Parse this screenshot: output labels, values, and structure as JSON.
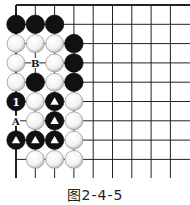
{
  "caption": "图2-4-5",
  "board": {
    "origin_x": 16,
    "origin_y": 5,
    "spacing": 19.3,
    "cols": 9,
    "rows": 10,
    "edges": {
      "top": true,
      "left": true,
      "right": false,
      "bottom": false
    },
    "stones": [
      {
        "col": 0,
        "row": 1,
        "color": "black"
      },
      {
        "col": 1,
        "row": 1,
        "color": "black"
      },
      {
        "col": 2,
        "row": 1,
        "color": "black"
      },
      {
        "col": 0,
        "row": 2,
        "color": "white"
      },
      {
        "col": 1,
        "row": 2,
        "color": "white"
      },
      {
        "col": 2,
        "row": 2,
        "color": "white"
      },
      {
        "col": 3,
        "row": 2,
        "color": "black"
      },
      {
        "col": 0,
        "row": 3,
        "color": "white"
      },
      {
        "col": 2,
        "row": 3,
        "color": "white"
      },
      {
        "col": 3,
        "row": 3,
        "color": "black"
      },
      {
        "col": 0,
        "row": 4,
        "color": "white"
      },
      {
        "col": 1,
        "row": 4,
        "color": "black"
      },
      {
        "col": 2,
        "row": 4,
        "color": "white"
      },
      {
        "col": 3,
        "row": 4,
        "color": "black"
      },
      {
        "col": 0,
        "row": 5,
        "color": "black",
        "label": "1"
      },
      {
        "col": 1,
        "row": 5,
        "color": "white"
      },
      {
        "col": 2,
        "row": 5,
        "color": "black",
        "mark": "triangle"
      },
      {
        "col": 3,
        "row": 5,
        "color": "white"
      },
      {
        "col": 1,
        "row": 6,
        "color": "white"
      },
      {
        "col": 2,
        "row": 6,
        "color": "black",
        "mark": "triangle"
      },
      {
        "col": 3,
        "row": 6,
        "color": "white"
      },
      {
        "col": 0,
        "row": 7,
        "color": "black",
        "mark": "triangle"
      },
      {
        "col": 1,
        "row": 7,
        "color": "black",
        "mark": "triangle"
      },
      {
        "col": 2,
        "row": 7,
        "color": "black",
        "mark": "triangle"
      },
      {
        "col": 3,
        "row": 7,
        "color": "white"
      },
      {
        "col": 1,
        "row": 8,
        "color": "white"
      },
      {
        "col": 2,
        "row": 8,
        "color": "white"
      },
      {
        "col": 3,
        "row": 8,
        "color": "white"
      }
    ],
    "point_labels": [
      {
        "col": 1,
        "row": 3,
        "text": "B"
      },
      {
        "col": 0,
        "row": 6,
        "text": "A"
      }
    ]
  }
}
